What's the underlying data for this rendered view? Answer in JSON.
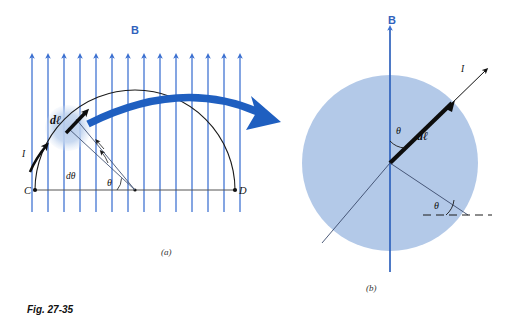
{
  "figure": {
    "caption": "Fig. 27-35",
    "panel_a_label": "(a)",
    "panel_b_label": "(b)"
  },
  "colors": {
    "field_blue": "#2f62bc",
    "field_line_blue": "#3a6fd0",
    "magnify_arrow_blue": "#1f5fc0",
    "disc_fill": "#b3c9e8",
    "highlight_fill": "#bdd0ec",
    "arc_black": "#1a1a1a",
    "thin_line": "#3a4a6b",
    "background": "#ffffff"
  },
  "panel_a": {
    "name": "semicircular current loop in uniform field",
    "field_label": "B",
    "field_arrow_count": 14,
    "current_label": "I",
    "element_label": "dℓ",
    "angle_label": "θ",
    "angle_increment_label": "dθ",
    "point_left_label": "C",
    "point_right_label": "D"
  },
  "panel_b": {
    "name": "magnified view of current element",
    "field_label": "B",
    "current_label": "I",
    "element_label": "dℓ",
    "angle_label_upper": "θ",
    "angle_label_lower": "θ"
  }
}
